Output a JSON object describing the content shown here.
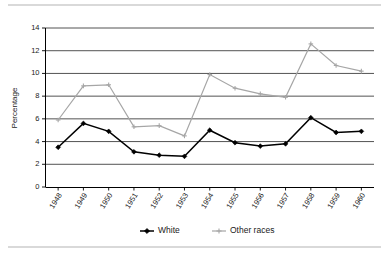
{
  "chart_data": {
    "type": "line",
    "title": "",
    "xlabel": "",
    "ylabel": "Percentage",
    "categories": [
      "1948",
      "1949",
      "1950",
      "1951",
      "1952",
      "1953",
      "1954",
      "1955",
      "1956",
      "1957",
      "1958",
      "1959",
      "1960"
    ],
    "series": [
      {
        "name": "White",
        "color": "#000000",
        "marker": "diamond",
        "values": [
          3.5,
          5.6,
          4.9,
          3.1,
          2.8,
          2.7,
          5.0,
          3.9,
          3.6,
          3.8,
          6.1,
          4.8,
          4.9
        ]
      },
      {
        "name": "Other races",
        "color": "#a6a6a6",
        "marker": "cross",
        "values": [
          5.9,
          8.9,
          9.0,
          5.3,
          5.4,
          4.5,
          9.9,
          8.7,
          8.2,
          7.9,
          12.6,
          10.7,
          10.2
        ]
      }
    ],
    "ylim": [
      0,
      14
    ],
    "ytick_labels": [
      "0",
      "2",
      "4",
      "6",
      "8",
      "10",
      "12",
      "14"
    ],
    "ytick_values": [
      0,
      2,
      4,
      6,
      8,
      10,
      12,
      14
    ],
    "grid": "horizontal",
    "legend_position": "bottom",
    "legend": [
      {
        "label": "White",
        "color": "#000000",
        "marker": "diamond"
      },
      {
        "label": "Other races",
        "color": "#a6a6a6",
        "marker": "cross"
      }
    ]
  },
  "decoration": {
    "top_rule_color": "#d9d9d9",
    "bottom_rule_color": "#d9d9d9",
    "background": "#ffffff"
  }
}
